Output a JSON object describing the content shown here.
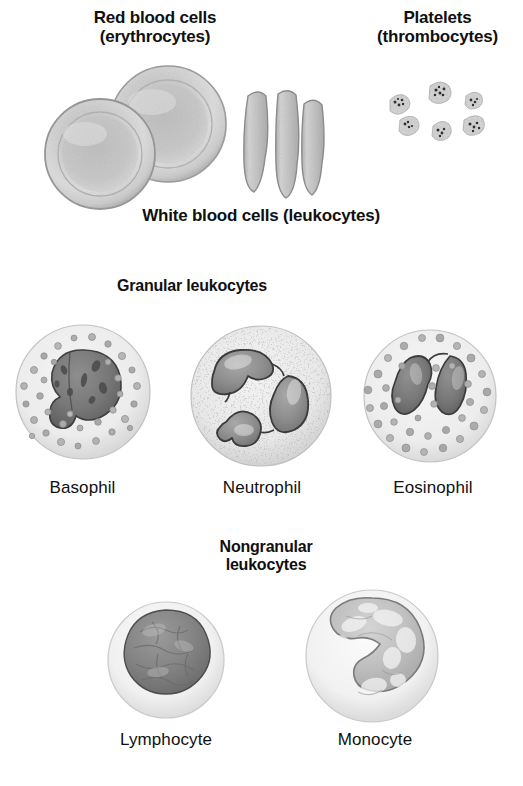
{
  "figure": {
    "title_rbc": "Red blood cells\n(erythrocytes)",
    "title_platelets": "Platelets\n(thrombocytes)",
    "title_wbc": "White blood cells (leukocytes)",
    "title_granular": "Granular leukocytes",
    "title_nongranular": "Nongranular\nleukocytes",
    "label_basophil": "Basophil",
    "label_neutrophil": "Neutrophil",
    "label_eosinophil": "Eosinophil",
    "label_lymphocyte": "Lymphocyte",
    "label_monocyte": "Monocyte"
  },
  "colors": {
    "background": "#ffffff",
    "text": "#101010",
    "rbc_fill": "#d8d8d8",
    "rbc_edge": "#9a9a9a",
    "rbc_center": "#c9c9c9",
    "platelet_fill": "#e0e0e0",
    "platelet_speck": "#3a3a3a",
    "cytoplasm_pale": "#efefef",
    "cytoplasm_edge": "#bdbdbd",
    "granule_dark": "#8a8a8a",
    "granule_mid": "#a6a6a6",
    "nucleus_dark": "#6f6f6f",
    "nucleus_mid": "#8e8e8e",
    "nucleus_light": "#b4b4b4",
    "nucleus_outline": "#3d3d3d"
  },
  "illustrations": {
    "erythrocytes_face_count": 2,
    "erythrocytes_edge_count": 3,
    "platelet_count": 6,
    "granular_cells": [
      "basophil",
      "neutrophil",
      "eosinophil"
    ],
    "nongranular_cells": [
      "lymphocyte",
      "monocyte"
    ],
    "basophil_nucleus_lobes": 2,
    "neutrophil_nucleus_lobes": 3,
    "eosinophil_nucleus_lobes": 2,
    "lymphocyte_nucleus_shape": "round",
    "monocyte_nucleus_shape": "kidney"
  }
}
